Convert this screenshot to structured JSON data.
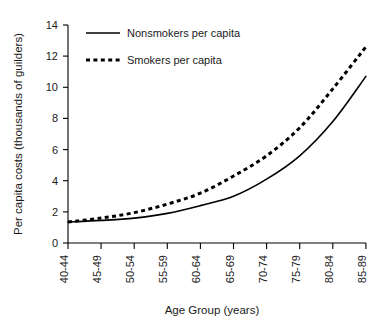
{
  "chart_data": {
    "type": "line",
    "title": "",
    "xlabel": "Age Group (years)",
    "ylabel": "Per capita costs (thousands of guilders)",
    "categories": [
      "40-44",
      "45-49",
      "50-54",
      "55-59",
      "60-64",
      "65-69",
      "70-74",
      "75-79",
      "80-84",
      "85-89"
    ],
    "series": [
      {
        "name": "Nonsmokers per capita",
        "style": "solid",
        "values": [
          1.35,
          1.45,
          1.6,
          1.9,
          2.4,
          3.0,
          4.1,
          5.6,
          7.8,
          10.7
        ]
      },
      {
        "name": "Smokers per capita",
        "style": "dashed",
        "values": [
          1.35,
          1.6,
          1.95,
          2.5,
          3.2,
          4.3,
          5.6,
          7.4,
          9.9,
          12.6
        ]
      }
    ],
    "ylim": [
      0,
      14
    ],
    "yticks": [
      0,
      2,
      4,
      6,
      8,
      10,
      12,
      14
    ],
    "ytick_labels": [
      "0",
      "2",
      "4",
      "6",
      "8",
      "10",
      "12",
      "14"
    ],
    "grid": false,
    "legend_position": "top-left-inside",
    "axis_color": "#000000"
  },
  "legend": {
    "entries": [
      {
        "label": "Nonsmokers per capita",
        "marker": "solid-line-icon"
      },
      {
        "label": "Smokers per capita",
        "marker": "dashed-line-icon"
      }
    ]
  }
}
